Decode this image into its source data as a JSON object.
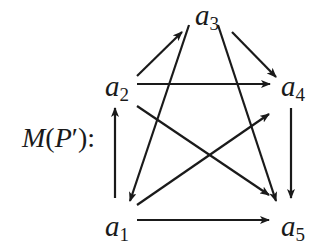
{
  "caption": {
    "prefix": "M",
    "open": "(",
    "var": "P",
    "prime": "′",
    "close": "):"
  },
  "nodes": [
    {
      "id": "a1",
      "base": "a",
      "sub": "1",
      "x": 105,
      "y": 212
    },
    {
      "id": "a2",
      "base": "a",
      "sub": "2",
      "x": 105,
      "y": 72
    },
    {
      "id": "a3",
      "base": "a",
      "sub": "3",
      "x": 195,
      "y": 1
    },
    {
      "id": "a4",
      "base": "a",
      "sub": "4",
      "x": 281,
      "y": 72
    },
    {
      "id": "a5",
      "base": "a",
      "sub": "5",
      "x": 281,
      "y": 212
    }
  ],
  "edges": [
    {
      "from": "a2",
      "to": "a3",
      "x1": 137,
      "y1": 76,
      "x2": 182,
      "y2": 32
    },
    {
      "from": "a3",
      "to": "a1",
      "x1": 189,
      "y1": 25,
      "x2": 130,
      "y2": 201
    },
    {
      "from": "a3",
      "to": "a5",
      "x1": 218,
      "y1": 25,
      "x2": 276,
      "y2": 201
    },
    {
      "from": "a3",
      "to": "a4",
      "x1": 232,
      "y1": 32,
      "x2": 276,
      "y2": 77
    },
    {
      "from": "a2",
      "to": "a4",
      "x1": 137,
      "y1": 84,
      "x2": 270,
      "y2": 84
    },
    {
      "from": "a2",
      "to": "a5",
      "x1": 137,
      "y1": 106,
      "x2": 269,
      "y2": 195
    },
    {
      "from": "a1",
      "to": "a4",
      "x1": 137,
      "y1": 205,
      "x2": 269,
      "y2": 114
    },
    {
      "from": "a1",
      "to": "a2",
      "x1": 115,
      "y1": 198,
      "x2": 115,
      "y2": 108
    },
    {
      "from": "a4",
      "to": "a5",
      "x1": 291,
      "y1": 108,
      "x2": 291,
      "y2": 198
    },
    {
      "from": "a1",
      "to": "a5",
      "x1": 137,
      "y1": 220,
      "x2": 269,
      "y2": 220
    }
  ],
  "style": {
    "stroke": "#1a1a1a",
    "stroke_width": 2.2
  }
}
